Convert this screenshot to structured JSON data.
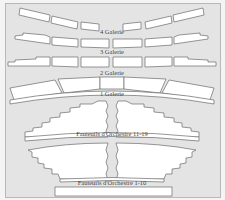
{
  "diagram": {
    "background_color": "#e4e4e4",
    "seat_fill": "#ffffff",
    "outline_color": "#6a6a6a",
    "sections": [
      {
        "id": "4-galerie",
        "label": "4 Galerie"
      },
      {
        "id": "3-galerie",
        "label": "3 Galerie"
      },
      {
        "id": "2-galerie",
        "label": "2 Galerie"
      },
      {
        "id": "1-galerie",
        "label": "1 Galerie"
      },
      {
        "id": "orchestre-11-19",
        "label": "Fauteuils d'Orchestre 11-19"
      },
      {
        "id": "orchestre-1-10",
        "label": "Fauteuils d'Orchestre 1-10"
      }
    ]
  }
}
